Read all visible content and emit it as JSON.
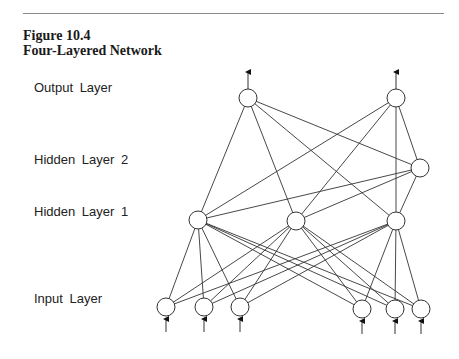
{
  "figure": {
    "number": "Figure 10.4",
    "title": "Four-Layered Network"
  },
  "layers": {
    "output": {
      "label": "Output Layer",
      "label_y": 88
    },
    "hidden2": {
      "label": "Hidden Layer 2",
      "label_y": 160
    },
    "hidden1": {
      "label": "Hidden Layer 1",
      "label_y": 212
    },
    "input": {
      "label": "Input Layer",
      "label_y": 299
    }
  },
  "nodes": {
    "output": [
      {
        "x": 248,
        "y": 98
      },
      {
        "x": 396,
        "y": 98
      }
    ],
    "hidden2": [
      {
        "x": 420,
        "y": 168
      }
    ],
    "hidden1": [
      {
        "x": 198,
        "y": 220
      },
      {
        "x": 296,
        "y": 221
      },
      {
        "x": 396,
        "y": 221
      }
    ],
    "input": [
      {
        "x": 166,
        "y": 307
      },
      {
        "x": 204,
        "y": 307
      },
      {
        "x": 240,
        "y": 307
      },
      {
        "x": 362,
        "y": 309
      },
      {
        "x": 395,
        "y": 309
      },
      {
        "x": 421,
        "y": 309
      }
    ]
  },
  "node_radius": 9,
  "connections": [
    [
      "output",
      "hidden1"
    ],
    [
      "output",
      "hidden2"
    ],
    [
      "hidden2",
      "hidden1"
    ],
    [
      "hidden1",
      "input"
    ]
  ],
  "colors": {
    "stroke": "#333333",
    "text": "#222222",
    "rule": "#8a8a8a"
  }
}
